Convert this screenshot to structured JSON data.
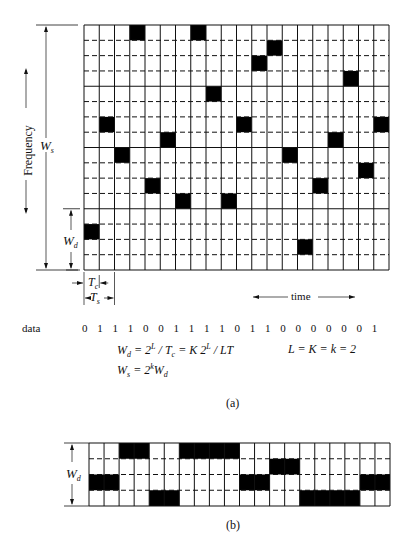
{
  "diagram_a": {
    "caption": "(a)",
    "cols": 20,
    "rows": 16,
    "rows_per_band": 4,
    "hops": [
      {
        "col": 3,
        "row": 0
      },
      {
        "col": 7,
        "row": 0
      },
      {
        "col": 12,
        "row": 1
      },
      {
        "col": 11,
        "row": 2
      },
      {
        "col": 17,
        "row": 3
      },
      {
        "col": 8,
        "row": 4
      },
      {
        "col": 1,
        "row": 6
      },
      {
        "col": 10,
        "row": 6
      },
      {
        "col": 19,
        "row": 6
      },
      {
        "col": 5,
        "row": 7
      },
      {
        "col": 16,
        "row": 7
      },
      {
        "col": 2,
        "row": 8
      },
      {
        "col": 13,
        "row": 8
      },
      {
        "col": 18,
        "row": 9
      },
      {
        "col": 4,
        "row": 10
      },
      {
        "col": 15,
        "row": 10
      },
      {
        "col": 6,
        "row": 11
      },
      {
        "col": 9,
        "row": 11
      },
      {
        "col": 0,
        "row": 13
      },
      {
        "col": 14,
        "row": 14
      }
    ],
    "labels": {
      "frequency": "Frequency",
      "ws": "W",
      "ws_sub": "s",
      "wd": "W",
      "wd_sub": "d",
      "tc": "T",
      "tc_sub": "c",
      "ts": "T",
      "ts_sub": "s",
      "time": "time"
    },
    "data_label": "data",
    "data_bits": [
      "0",
      "1",
      "1",
      "1",
      "0",
      "0",
      "1",
      "1",
      "1",
      "1",
      "0",
      "1",
      "1",
      "0",
      "0",
      "0",
      "0",
      "0",
      "0",
      "1"
    ],
    "eq1": {
      "lhs": "W",
      "lhs_sub": "d",
      "p1": " = 2",
      "sup1": "L",
      "p2": " / T",
      "sub2": "c",
      "p3": " = K 2",
      "sup3": "L",
      "p4": " / LT"
    },
    "eq2": {
      "lhs": "W",
      "lhs_sub": "s",
      "p1": " = 2",
      "sup1": "k",
      "p2": "W",
      "sub2": "d"
    },
    "eq3": "L = K = k = 2"
  },
  "diagram_b": {
    "caption": "(b)",
    "cols": 20,
    "rows": 4,
    "label": "W",
    "label_sub": "d",
    "blocks": [
      {
        "row": 0,
        "start": 2,
        "len": 2
      },
      {
        "row": 0,
        "start": 6,
        "len": 4
      },
      {
        "row": 1,
        "start": 12,
        "len": 2
      },
      {
        "row": 2,
        "start": 0,
        "len": 2
      },
      {
        "row": 2,
        "start": 10,
        "len": 2
      },
      {
        "row": 2,
        "start": 18,
        "len": 2
      },
      {
        "row": 3,
        "start": 4,
        "len": 2
      },
      {
        "row": 3,
        "start": 14,
        "len": 4
      }
    ]
  },
  "colors": {
    "ink": "#111111",
    "fill": "#000000",
    "paper": "#ffffff"
  }
}
